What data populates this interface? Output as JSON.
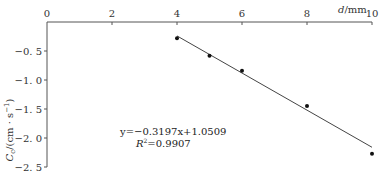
{
  "chart_data": {
    "type": "scatter",
    "title": "",
    "xlabel": "d/mm",
    "ylabel": "C_c/(cm·s⁻¹)",
    "xlim": [
      0,
      10
    ],
    "ylim": [
      -2.5,
      0
    ],
    "x_ticks": [
      "0",
      "2",
      "4",
      "6",
      "8",
      "10"
    ],
    "y_ticks": [
      "-0.5",
      "-1.0",
      "-1.5",
      "-2.0",
      "-2.5"
    ],
    "grid": false,
    "series": [
      {
        "name": "measured",
        "x": [
          4,
          5,
          6,
          8,
          10
        ],
        "y": [
          -0.28,
          -0.58,
          -0.84,
          -1.45,
          -2.27
        ]
      }
    ],
    "fit_line": {
      "slope": -0.3197,
      "intercept": 1.0509,
      "x_range": [
        4,
        10
      ]
    },
    "annotations": {
      "equation": "y=−0.3197x+1.0509",
      "r2_label": "R",
      "r2_sup": "2",
      "r2_value": "=0.9907"
    },
    "x_axis_label_d": "d",
    "x_axis_label_unit": "/mm"
  }
}
